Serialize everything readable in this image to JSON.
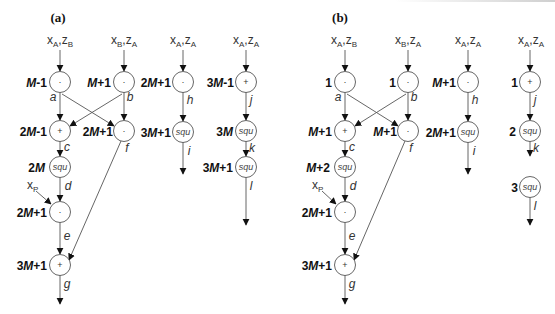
{
  "figure": {
    "panels": [
      {
        "id": "a",
        "label": "(a)",
        "inputs": [
          {
            "id": "in1",
            "base": "x",
            "sub1": "A",
            "sep": ",",
            "base2": "z",
            "sub2": "B"
          },
          {
            "id": "in2",
            "base": "x",
            "sub1": "B",
            "sep": ",",
            "base2": "z",
            "sub2": "A"
          },
          {
            "id": "in3",
            "base": "x",
            "sub1": "A",
            "sep": ",",
            "base2": "z",
            "sub2": "A"
          },
          {
            "id": "in4",
            "base": "x",
            "sub1": "A",
            "sep": ",",
            "base2": "z",
            "sub2": "A"
          }
        ],
        "nodes": [
          {
            "id": "a",
            "op": "·",
            "label_pre": "",
            "label_M": "M",
            "label_post": "-1",
            "edge": "a"
          },
          {
            "id": "b",
            "op": "·",
            "label_pre": "",
            "label_M": "M",
            "label_post": "+1",
            "edge": "b"
          },
          {
            "id": "c",
            "op": "+",
            "label_pre": "2",
            "label_M": "M",
            "label_post": "-1",
            "edge": "c"
          },
          {
            "id": "f",
            "op": "·",
            "label_pre": "2",
            "label_M": "M",
            "label_post": "+1",
            "edge": "f"
          },
          {
            "id": "d",
            "op": "squ",
            "label_pre": "2",
            "label_M": "M",
            "label_post": "",
            "edge": "d"
          },
          {
            "id": "e",
            "op": "·",
            "label_pre": "2",
            "label_M": "M",
            "label_post": "+1",
            "edge": "e"
          },
          {
            "id": "g",
            "op": "+",
            "label_pre": "3",
            "label_M": "M",
            "label_post": "+1",
            "edge": "g"
          },
          {
            "id": "h",
            "op": "·",
            "label_pre": "2",
            "label_M": "M",
            "label_post": "+1",
            "edge": "h"
          },
          {
            "id": "i",
            "op": "squ",
            "label_pre": "3",
            "label_M": "M",
            "label_post": "+1",
            "edge": "i"
          },
          {
            "id": "j",
            "op": "+",
            "label_pre": "3",
            "label_M": "M",
            "label_post": "-1",
            "edge": "j"
          },
          {
            "id": "k",
            "op": "squ",
            "label_pre": "3",
            "label_M": "M",
            "label_post": "",
            "edge": "k"
          },
          {
            "id": "l",
            "op": "squ",
            "label_pre": "3",
            "label_M": "M",
            "label_post": "+1",
            "edge": "l"
          }
        ],
        "extra_input": {
          "base": "x",
          "sub": "P"
        }
      },
      {
        "id": "b",
        "label": "(b)",
        "inputs": [
          {
            "id": "in1",
            "base": "x",
            "sub1": "A",
            "sep": ",",
            "base2": "z",
            "sub2": "B"
          },
          {
            "id": "in2",
            "base": "x",
            "sub1": "B",
            "sep": ",",
            "base2": "z",
            "sub2": "A"
          },
          {
            "id": "in3",
            "base": "x",
            "sub1": "A",
            "sep": ",",
            "base2": "z",
            "sub2": "A"
          },
          {
            "id": "in4",
            "base": "x",
            "sub1": "A",
            "sep": ",",
            "base2": "z",
            "sub2": "A"
          }
        ],
        "nodes": [
          {
            "id": "a",
            "op": "·",
            "label_pre": "1",
            "label_M": "",
            "label_post": "",
            "edge": "a"
          },
          {
            "id": "b",
            "op": "·",
            "label_pre": "1",
            "label_M": "",
            "label_post": "",
            "edge": "b"
          },
          {
            "id": "c",
            "op": "+",
            "label_pre": "",
            "label_M": "M",
            "label_post": "+1",
            "edge": "c"
          },
          {
            "id": "f",
            "op": "·",
            "label_pre": "",
            "label_M": "M",
            "label_post": "+1",
            "edge": "f"
          },
          {
            "id": "d",
            "op": "squ",
            "label_pre": "",
            "label_M": "M",
            "label_post": "+2",
            "edge": "d"
          },
          {
            "id": "e",
            "op": "·",
            "label_pre": "2",
            "label_M": "M",
            "label_post": "+1",
            "edge": "e"
          },
          {
            "id": "g",
            "op": "+",
            "label_pre": "3",
            "label_M": "M",
            "label_post": "+1",
            "edge": "g"
          },
          {
            "id": "h",
            "op": "·",
            "label_pre": "",
            "label_M": "M",
            "label_post": "+1",
            "edge": "h"
          },
          {
            "id": "i",
            "op": "squ",
            "label_pre": "2",
            "label_M": "M",
            "label_post": "+1",
            "edge": "i"
          },
          {
            "id": "j",
            "op": "+",
            "label_pre": "1",
            "label_M": "",
            "label_post": "",
            "edge": "j"
          },
          {
            "id": "k",
            "op": "squ",
            "label_pre": "2",
            "label_M": "",
            "label_post": "",
            "edge": "k"
          },
          {
            "id": "l",
            "op": "squ",
            "label_pre": "3",
            "label_M": "",
            "label_post": "",
            "edge": "l"
          }
        ],
        "extra_input": {
          "base": "x",
          "sub": "P"
        }
      }
    ],
    "colors": {
      "stroke": "#555555",
      "text": "#111111",
      "background": "#ffffff"
    }
  }
}
